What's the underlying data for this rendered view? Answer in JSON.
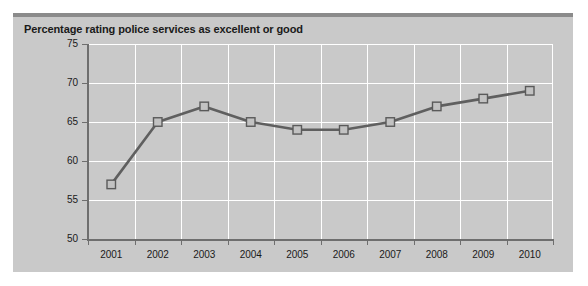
{
  "chart_data": {
    "type": "line",
    "title": "Percentage rating police services as excellent or good",
    "xlabel": "",
    "ylabel": "",
    "categories": [
      "2001",
      "2002",
      "2003",
      "2004",
      "2005",
      "2006",
      "2007",
      "2008",
      "2009",
      "2010"
    ],
    "values": [
      57,
      65,
      67,
      65,
      64,
      64,
      65,
      67,
      68,
      69
    ],
    "series": [
      {
        "name": "Percentage rating police services as excellent or good",
        "values": [
          57,
          65,
          67,
          65,
          64,
          64,
          65,
          67,
          68,
          69
        ]
      }
    ],
    "ylim": [
      50,
      75
    ],
    "yticks": [
      50,
      55,
      60,
      65,
      70,
      75
    ],
    "ytick_labels": [
      "50",
      "55",
      "60",
      "65",
      "70",
      "75"
    ],
    "xtick_labels": [
      "2001",
      "2002",
      "2003",
      "2004",
      "2005",
      "2006",
      "2007",
      "2008",
      "2009",
      "2010"
    ],
    "grid": true,
    "grid_color": "#ffffff",
    "legend": false,
    "legend_position": "none",
    "marker": "square",
    "line_color": "#5f5f5f",
    "marker_fill": "#c2c2c2",
    "marker_edge": "#5a5a5a",
    "plot_background": "#c9c9c9",
    "panel_background": "#c9c9c9",
    "page_background": "#ffffff",
    "axis_color": "#6e6e6e",
    "text_color": "#1a1a1a"
  }
}
